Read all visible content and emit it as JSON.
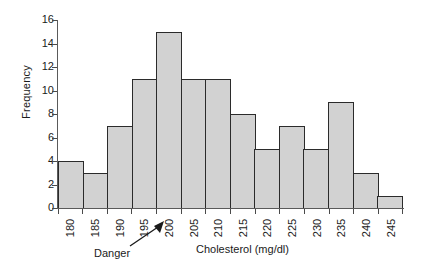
{
  "chart_data": {
    "type": "bar",
    "title": "",
    "subtitle": "",
    "xlabel": "Cholesterol (mg/dl)",
    "ylabel": "Frequency",
    "categories": [
      "180",
      "185",
      "190",
      "195",
      "200",
      "205",
      "210",
      "215",
      "220",
      "225",
      "230",
      "235",
      "240",
      "245"
    ],
    "values": [
      4,
      3,
      7,
      11,
      15,
      11,
      11,
      8,
      5,
      7,
      5,
      9,
      3,
      1
    ],
    "ylim": [
      0,
      16
    ],
    "yticks": [
      0,
      2,
      4,
      6,
      8,
      10,
      12,
      14,
      16
    ],
    "grid": false,
    "legend": null,
    "annotations": [
      {
        "text": "Danger",
        "points_to_category": "200"
      }
    ],
    "style": {
      "bar_fill": "#d2d2d2",
      "bar_border": "#2b2b2b",
      "axis_color": "#5a5a5a",
      "text_color": "#1a1a1a",
      "background": "#ffffff"
    }
  }
}
